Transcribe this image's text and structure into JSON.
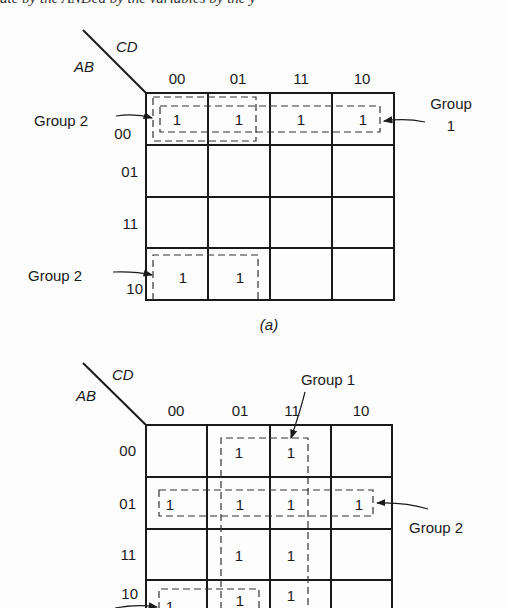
{
  "top_clipped_text": "ate by the  ANDed  by  the  variables  by the  y",
  "map_a": {
    "caption": "(a)",
    "row_var": "AB",
    "col_var": "CD",
    "col_labels": [
      "00",
      "01",
      "11",
      "10"
    ],
    "row_labels": [
      "00",
      "01",
      "11",
      "10"
    ],
    "cells": [
      [
        "1",
        "1",
        "1",
        "1"
      ],
      [
        "",
        "",
        "",
        ""
      ],
      [
        "",
        "",
        "",
        ""
      ],
      [
        "1",
        "1",
        "",
        ""
      ]
    ],
    "annotations": {
      "group2_top": "Group 2",
      "group2_bottom": "Group 2",
      "group1_line1": "Group",
      "group1_line2": "1"
    }
  },
  "map_b": {
    "row_var": "AB",
    "col_var": "CD",
    "col_labels": [
      "00",
      "01",
      "11",
      "10"
    ],
    "row_labels": [
      "00",
      "01",
      "11",
      "10"
    ],
    "cells": [
      [
        "",
        "1",
        "1",
        ""
      ],
      [
        "1",
        "1",
        "1",
        "1"
      ],
      [
        "",
        "1",
        "1",
        ""
      ],
      [
        "1",
        "1",
        "1",
        ""
      ]
    ],
    "annotations": {
      "group1": "Group 1",
      "group2": "Group 2"
    }
  }
}
